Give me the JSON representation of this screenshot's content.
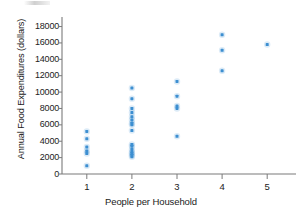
{
  "chart_data": {
    "type": "scatter",
    "title": "",
    "xlabel": "People per Household",
    "ylabel": "Annual Food Expenditures (dollars)",
    "xlim": [
      0.45,
      5.55
    ],
    "ylim": [
      0,
      18800
    ],
    "grid": false,
    "legend": "none",
    "marker_color": "#3d8fd1",
    "x_ticks": [
      "1",
      "2",
      "3",
      "4",
      "5"
    ],
    "x_tick_values": [
      1,
      2,
      3,
      4,
      5
    ],
    "y_ticks": [
      "0",
      "2000",
      "4000",
      "6000",
      "8000",
      "10000",
      "12000",
      "14000",
      "16000",
      "18000"
    ],
    "y_tick_values": [
      0,
      2000,
      4000,
      6000,
      8000,
      10000,
      12000,
      14000,
      16000,
      18000
    ],
    "points": [
      {
        "x": 1,
        "y": 1000
      },
      {
        "x": 1,
        "y": 2500
      },
      {
        "x": 1,
        "y": 2800
      },
      {
        "x": 1,
        "y": 3300
      },
      {
        "x": 1,
        "y": 4300
      },
      {
        "x": 1,
        "y": 5200
      },
      {
        "x": 2,
        "y": 2100
      },
      {
        "x": 2,
        "y": 2300
      },
      {
        "x": 2,
        "y": 2500
      },
      {
        "x": 2,
        "y": 2700
      },
      {
        "x": 2,
        "y": 3000
      },
      {
        "x": 2,
        "y": 3400
      },
      {
        "x": 2,
        "y": 3600
      },
      {
        "x": 2,
        "y": 5300
      },
      {
        "x": 2,
        "y": 6000
      },
      {
        "x": 2,
        "y": 6200
      },
      {
        "x": 2,
        "y": 6600
      },
      {
        "x": 2,
        "y": 7000
      },
      {
        "x": 2,
        "y": 7500
      },
      {
        "x": 2,
        "y": 8000
      },
      {
        "x": 2,
        "y": 9200
      },
      {
        "x": 2,
        "y": 10500
      },
      {
        "x": 3,
        "y": 4600
      },
      {
        "x": 3,
        "y": 8000
      },
      {
        "x": 3,
        "y": 8300
      },
      {
        "x": 3,
        "y": 9500
      },
      {
        "x": 3,
        "y": 11300
      },
      {
        "x": 4,
        "y": 12600
      },
      {
        "x": 4,
        "y": 15100
      },
      {
        "x": 4,
        "y": 17000
      },
      {
        "x": 5,
        "y": 15800
      }
    ]
  },
  "axes": {
    "axis_color": "#7a7a7a",
    "tick_color": "#7a7a7a"
  }
}
